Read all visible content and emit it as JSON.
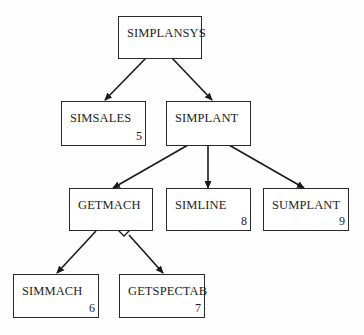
{
  "diagram": {
    "type": "structure-chart",
    "nodes": [
      {
        "id": "simplansys",
        "label": "SIMPLANSYS",
        "number": ""
      },
      {
        "id": "simsales",
        "label": "SIMSALES",
        "number": "5"
      },
      {
        "id": "simplant",
        "label": "SIMPLANT",
        "number": ""
      },
      {
        "id": "getmach",
        "label": "GETMACH",
        "number": ""
      },
      {
        "id": "simline",
        "label": "SIMLINE",
        "number": "8"
      },
      {
        "id": "sumplant",
        "label": "SUMPLANT",
        "number": "9"
      },
      {
        "id": "simmach",
        "label": "SIMMACH",
        "number": "6"
      },
      {
        "id": "getspectab",
        "label": "GETSPECTAB",
        "number": "7"
      }
    ],
    "edges": [
      {
        "from": "simplansys",
        "to": "simsales"
      },
      {
        "from": "simplansys",
        "to": "simplant"
      },
      {
        "from": "simplant",
        "to": "getmach"
      },
      {
        "from": "simplant",
        "to": "simline"
      },
      {
        "from": "simplant",
        "to": "sumplant"
      },
      {
        "from": "getmach",
        "to": "simmach"
      },
      {
        "from": "getmach",
        "to": "getspectab",
        "decision_diamond": true
      }
    ],
    "colors": {
      "line": "#1a1a1a",
      "box_border": "#2a2a2a",
      "background": "#ffffff"
    }
  }
}
